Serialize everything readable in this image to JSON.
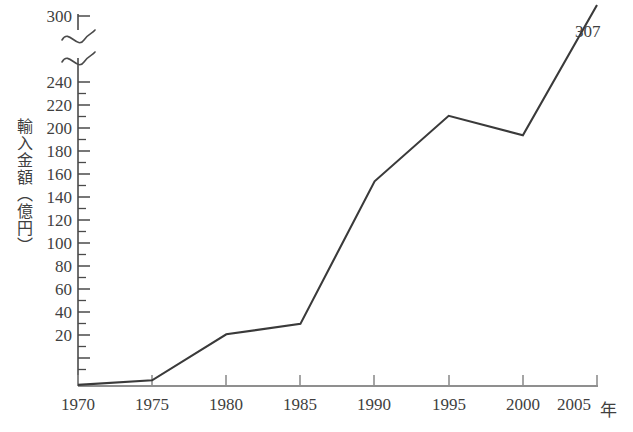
{
  "chart_data": {
    "type": "line",
    "title": "",
    "xlabel": "年",
    "ylabel": "輸入金額（億円）",
    "x": [
      1970,
      1975,
      1980,
      1985,
      1990,
      1995,
      2000,
      2005
    ],
    "categories": [
      "1970",
      "1975",
      "1980",
      "1985",
      "1990",
      "1995",
      "2000",
      "2005"
    ],
    "values": [
      1,
      5,
      45,
      54,
      178,
      235,
      218,
      307
    ],
    "series": [
      {
        "name": "輸入金額",
        "values": [
          1,
          5,
          45,
          54,
          178,
          235,
          218,
          307
        ]
      }
    ],
    "xlim": [
      1970,
      2005
    ],
    "ylim": [
      0,
      300
    ],
    "ytick_labels": [
      "20",
      "40",
      "60",
      "80",
      "100",
      "120",
      "140",
      "160",
      "180",
      "200",
      "220",
      "240",
      "300"
    ],
    "ytick_values": [
      20,
      40,
      60,
      80,
      100,
      120,
      140,
      160,
      180,
      200,
      220,
      240,
      300
    ],
    "yminor_step": 10,
    "xtick_labels": [
      "1970",
      "1975",
      "1980",
      "1985",
      "1990",
      "1995",
      "2000",
      "2005"
    ],
    "axis_break": {
      "present": true,
      "between": [
        240,
        300
      ],
      "style": "squiggle"
    },
    "annotations": [
      {
        "text": "307",
        "at_x": 2005,
        "at_y": 307
      }
    ],
    "grid": false,
    "legend": false,
    "legend_position": "none",
    "line_color": "#3a3a3a",
    "axis_color": "#4a4a4a",
    "background": "#ffffff"
  },
  "axis_unit_suffix": "年"
}
